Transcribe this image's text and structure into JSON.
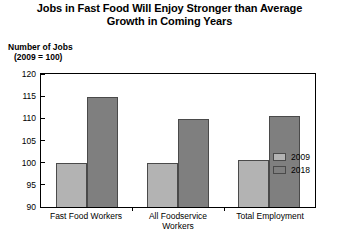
{
  "chart_data": {
    "type": "bar",
    "title": "Jobs in Fast Food Will Enjoy Stronger than Average Growth in Coming Years",
    "title_line1": "Jobs in Fast Food Will Enjoy Stronger than Average",
    "title_line2": "Growth in Coming Years",
    "ylabel_line1": "Number of Jobs",
    "ylabel_line2": "(2009 = 100)",
    "xlabel": "",
    "categories": [
      "Fast Food Workers",
      "All Foodservice Workers",
      "Total Employment"
    ],
    "category_lines": [
      [
        "Fast Food Workers"
      ],
      [
        "All Foodservice",
        "Workers"
      ],
      [
        "Total Employment"
      ]
    ],
    "series": [
      {
        "name": "2009",
        "color": "#b3b3b3",
        "values": [
          100.0,
          100.0,
          100.5
        ]
      },
      {
        "name": "2018",
        "color": "#7f7f7f",
        "values": [
          114.8,
          109.8,
          110.5
        ]
      }
    ],
    "ylim": [
      90,
      120
    ],
    "yticks": [
      120,
      115,
      110,
      105,
      100,
      95,
      90
    ],
    "grid": false,
    "legend_position": "top-right",
    "legend_entries": [
      "2009",
      "2018"
    ]
  }
}
